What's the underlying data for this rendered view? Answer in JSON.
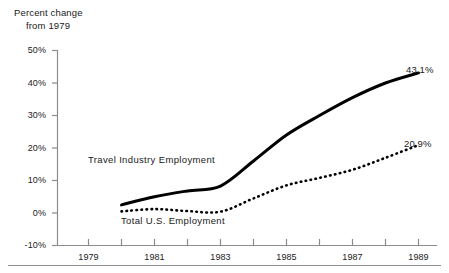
{
  "figure": {
    "axis_caption_line1": "Percent change",
    "axis_caption_line2": "from 1979"
  },
  "labels": {
    "travel_series": "Travel Industry Employment",
    "total_series": "Total U.S. Employment",
    "travel_end_value": "43.1%",
    "total_end_value": "20.9%"
  },
  "chart_data": {
    "type": "line",
    "title": "Percent change from 1979",
    "xlabel": "",
    "ylabel": "Percent change from 1979",
    "grid": false,
    "legend": "inline-annotations",
    "xlim": [
      1978.5,
      1990.5
    ],
    "ylim": [
      -10,
      50
    ],
    "ytick_labels": [
      "50%",
      "40%",
      "30%",
      "20%",
      "10%",
      "0%",
      "-10%"
    ],
    "ytick_values": [
      50,
      40,
      30,
      20,
      10,
      0,
      -10
    ],
    "xtick_labels": [
      "1979",
      "1981",
      "1983",
      "1985",
      "1987",
      "1989"
    ],
    "xtick_values": [
      1979,
      1981,
      1983,
      1985,
      1987,
      1989
    ],
    "xtick_minor_values": [
      1980,
      1982,
      1984,
      1986,
      1988,
      1990
    ],
    "x": [
      1980,
      1981,
      1982,
      1983,
      1984,
      1985,
      1986,
      1987,
      1988,
      1989
    ],
    "series": [
      {
        "name": "Travel Industry Employment",
        "style": "solid",
        "color": "#000000",
        "end_label": "43.1%",
        "values": [
          2.5,
          5.0,
          6.8,
          8.3,
          16.0,
          24.0,
          30.0,
          35.5,
          40.0,
          43.1
        ]
      },
      {
        "name": "Total U.S. Employment",
        "style": "dotted",
        "color": "#000000",
        "end_label": "20.9%",
        "values": [
          0.5,
          1.2,
          0.6,
          0.4,
          4.5,
          8.5,
          10.8,
          13.3,
          17.0,
          20.9
        ]
      }
    ],
    "annotations": [
      {
        "text": "Travel Industry Employment",
        "x": 1981.2,
        "y": 15.0
      },
      {
        "text": "Total U.S. Employment",
        "x": 1982.0,
        "y": -4.0
      }
    ]
  }
}
